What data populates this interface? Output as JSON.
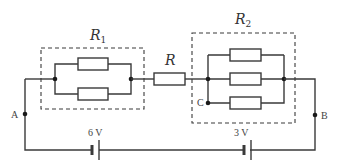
{
  "diagram": {
    "type": "circuit",
    "groups": [
      {
        "id": "R1",
        "label": "R",
        "subscript": "1",
        "resistors": 2,
        "arrangement": "parallel"
      },
      {
        "id": "R2",
        "label": "R",
        "subscript": "2",
        "resistors": 3,
        "arrangement": "parallel"
      }
    ],
    "series_resistor": {
      "label": "R"
    },
    "nodes": {
      "A": "A",
      "B": "B",
      "C": "C"
    },
    "batteries": [
      {
        "id": "battery-6v",
        "label": "6 V"
      },
      {
        "id": "battery-3v",
        "label": "3 V"
      }
    ]
  }
}
